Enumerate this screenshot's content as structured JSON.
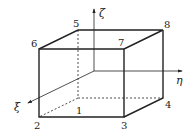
{
  "diagram": {
    "axes": {
      "zeta": {
        "label": "ζ"
      },
      "eta": {
        "label": "η"
      },
      "xi": {
        "label": "ξ"
      }
    },
    "nodes": [
      {
        "id": "1",
        "label": "1",
        "x": 78,
        "y": 98
      },
      {
        "id": "2",
        "label": "2",
        "x": 39,
        "y": 117
      },
      {
        "id": "3",
        "label": "3",
        "x": 124,
        "y": 117
      },
      {
        "id": "4",
        "label": "4",
        "x": 163,
        "y": 98
      },
      {
        "id": "5",
        "label": "5",
        "x": 78,
        "y": 30
      },
      {
        "id": "6",
        "label": "6",
        "x": 39,
        "y": 49
      },
      {
        "id": "7",
        "label": "7",
        "x": 124,
        "y": 49
      },
      {
        "id": "8",
        "label": "8",
        "x": 163,
        "y": 30
      }
    ],
    "colors": {
      "line": "#222222",
      "background": "#ffffff"
    }
  }
}
